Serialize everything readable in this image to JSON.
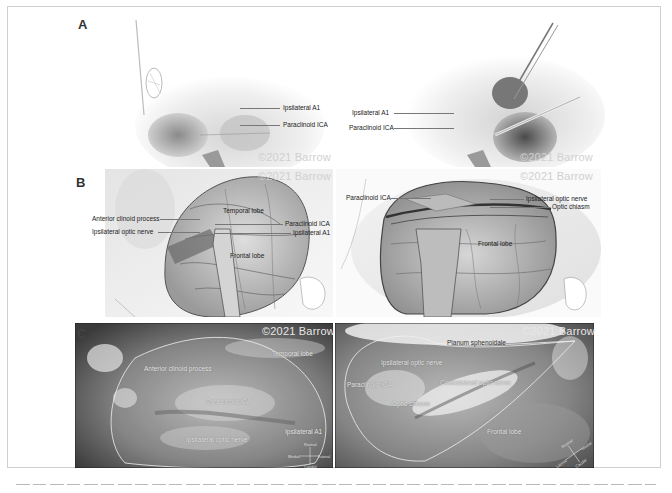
{
  "figure": {
    "copyright": "©2021 Barrow",
    "caption_visible": false
  },
  "panel_a": {
    "letter": "A",
    "left": {
      "labels": [
        "Ipsilateral A1",
        "Paraclinoid ICA"
      ],
      "copyright": "©2021 Barrow"
    },
    "right": {
      "labels": [
        "Ipsilateral A1",
        "Paraclinoid ICA"
      ],
      "copyright": "©2021 Barrow"
    }
  },
  "panel_b": {
    "letter": "B",
    "left": {
      "copyright": "©2021 Barrow",
      "labels": {
        "anterior_clinoid": "Anterior clinoid process",
        "optic_nerve": "Ipsilateral optic nerve",
        "temporal_lobe": "Temporal lobe",
        "paraclinoid_ica": "Paraclinoid ICA",
        "ipsilateral_a1": "Ipsilateral A1",
        "frontal_lobe": "Frontal lobe"
      }
    },
    "right": {
      "copyright": "©2021 Barrow",
      "labels": {
        "paraclinoid_ica": "Paraclinoid ICA",
        "optic_nerve": "Ipsilateral optic nerve",
        "optic_chiasm": "Optic chiasm",
        "frontal_lobe": "Frontal lobe"
      }
    }
  },
  "panel_c": {
    "letter": "C",
    "left": {
      "copyright": "©2021 Barrow",
      "labels": {
        "temporal_lobe": "Temporal lobe",
        "anterior_clinoid": "Anterior clinoid process",
        "paraclinoid_ica": "Paraclinoid ICA",
        "ipsilateral_a1": "Ipsilateral A1",
        "optic_nerve": "Ipsilateral optic nerve"
      },
      "compass": {
        "top": "Rostral",
        "left": "Medial",
        "right": "Lateral",
        "bottom": "Caudal"
      }
    },
    "right": {
      "copyright": "©2021 Barrow",
      "labels": {
        "planum": "Planum sphenoidale",
        "optic_nerve": "Ipsilateral optic nerve",
        "paraclinoid_ica": "Paraclinoid ICA",
        "contralateral_optic": "Contralateral optic nerve",
        "optic_chiasm": "Optic chiasm",
        "frontal_lobe": "Frontal lobe"
      },
      "compass": {
        "top": "Rostral",
        "left": "Lateral",
        "right": "Medial",
        "bottom": "Caudal"
      }
    }
  }
}
